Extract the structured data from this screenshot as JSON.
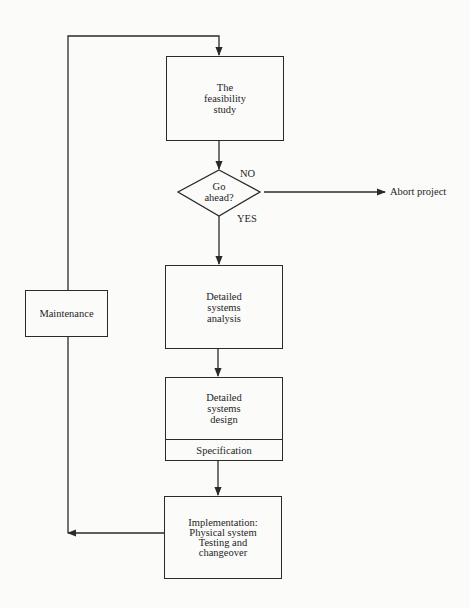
{
  "diagram": {
    "type": "flowchart",
    "title": "",
    "nodes": {
      "feasibility": {
        "label": "The\nfeasibility\nstudy",
        "shape": "rectangle"
      },
      "decision": {
        "label": "Go\nahead?",
        "shape": "diamond"
      },
      "abort": {
        "label": "Abort project",
        "shape": "terminal-text"
      },
      "analysis": {
        "label": "Detailed\nsystems\nanalysis",
        "shape": "rectangle"
      },
      "design": {
        "label": "Detailed\nsystems\ndesign",
        "sub_label": "Specification",
        "shape": "rectangle-with-footer"
      },
      "implementation": {
        "label": "Implementation:\nPhysical system\nTesting and\nchangeover",
        "shape": "rectangle"
      },
      "maintenance": {
        "label": "Maintenance",
        "shape": "rectangle"
      }
    },
    "edge_labels": {
      "no": "NO",
      "yes": "YES"
    },
    "edges": [
      {
        "from": "feasibility",
        "to": "decision"
      },
      {
        "from": "decision",
        "to": "abort",
        "label": "NO"
      },
      {
        "from": "decision",
        "to": "analysis",
        "label": "YES"
      },
      {
        "from": "analysis",
        "to": "design"
      },
      {
        "from": "design",
        "to": "implementation"
      },
      {
        "from": "implementation",
        "to": "maintenance"
      },
      {
        "from": "maintenance",
        "to": "feasibility"
      }
    ],
    "colors": {
      "line": "#2a2a2a",
      "background": "#fbfbfa"
    }
  }
}
